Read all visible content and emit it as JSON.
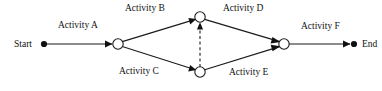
{
  "diagram": {
    "type": "activity-on-arrow-network",
    "title_visible": false,
    "background_color": "#ffffff",
    "line_color": "#1a1a1a",
    "terminal": {
      "start_label": "Start",
      "end_label": "End"
    },
    "activities": [
      {
        "id": "a",
        "label": "Activity A",
        "from": "start",
        "to": "n1",
        "style": "solid"
      },
      {
        "id": "b",
        "label": "Activity B",
        "from": "n1",
        "to": "n2",
        "style": "solid"
      },
      {
        "id": "c",
        "label": "Activity C",
        "from": "n1",
        "to": "n3",
        "style": "solid"
      },
      {
        "id": "d",
        "label": "Activity D",
        "from": "n2",
        "to": "n4",
        "style": "solid"
      },
      {
        "id": "e",
        "label": "Activity E",
        "from": "n3",
        "to": "n4",
        "style": "solid"
      },
      {
        "id": "f",
        "label": "Activity F",
        "from": "n4",
        "to": "end",
        "style": "solid"
      },
      {
        "id": "dummy",
        "label": "",
        "from": "n3",
        "to": "n2",
        "style": "dashed"
      }
    ],
    "nodes": [
      {
        "id": "start",
        "kind": "terminal-dot",
        "x": 44,
        "y": 44
      },
      {
        "id": "n1",
        "kind": "event-circle",
        "x": 118,
        "y": 44
      },
      {
        "id": "n2",
        "kind": "event-circle",
        "x": 200,
        "y": 17
      },
      {
        "id": "n3",
        "kind": "event-circle",
        "x": 200,
        "y": 72
      },
      {
        "id": "n4",
        "kind": "event-circle",
        "x": 284,
        "y": 44
      },
      {
        "id": "end",
        "kind": "terminal-dot",
        "x": 354,
        "y": 44
      }
    ]
  }
}
